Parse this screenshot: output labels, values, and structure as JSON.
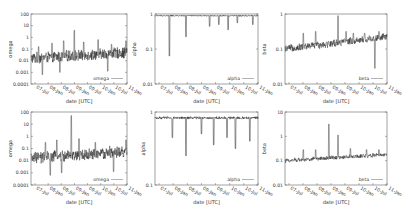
{
  "figure": {
    "x_tick_labels": [
      "07-Jul",
      "08-Jan",
      "08-Jul",
      "09-Jan",
      "09-Jul",
      "10-Jan",
      "10-Jul",
      "11-Jan"
    ],
    "xlabel": "date [UTC]"
  },
  "panels": [
    {
      "id": "top-omega",
      "ylabel": "omega",
      "legend": "omega",
      "yticks": [
        "100",
        "10",
        "1",
        "0.1",
        "0.01",
        "0.001",
        "0.0001"
      ],
      "ylog": [
        -4,
        2
      ]
    },
    {
      "id": "top-alpha",
      "ylabel": "alpha",
      "legend": "alpha",
      "yticks": [
        "1",
        "0.1",
        "0.01"
      ],
      "ylog": [
        -2,
        0
      ]
    },
    {
      "id": "top-beta",
      "ylabel": "beta",
      "legend": "beta",
      "yticks": [
        "1",
        "0.1",
        "0.01"
      ],
      "ylog": [
        -2,
        0
      ]
    },
    {
      "id": "bottom-omega",
      "ylabel": "omega",
      "legend": "omega",
      "yticks": [
        "100",
        "10",
        "1",
        "0.1",
        "0.01",
        "0.001",
        "0.0001"
      ],
      "ylog": [
        -4,
        2
      ]
    },
    {
      "id": "bottom-alpha",
      "ylabel": "alpha",
      "legend": "alpha",
      "yticks": [
        "1",
        "0.1"
      ],
      "ylog": [
        -1,
        0
      ]
    },
    {
      "id": "bottom-beta",
      "ylabel": "beta",
      "legend": "beta",
      "yticks": [
        "10",
        "1",
        "0.1",
        "0.01"
      ],
      "ylog": [
        -2,
        1
      ]
    }
  ],
  "chart_data": [
    {
      "type": "line",
      "title": "",
      "xlabel": "date [UTC]",
      "ylabel": "omega",
      "yscale": "log",
      "ylim": [
        0.0001,
        100
      ],
      "x_tick_labels": [
        "07-Jul",
        "08-Jan",
        "08-Jul",
        "09-Jan",
        "09-Jul",
        "10-Jan",
        "10-Jul",
        "11-Jan"
      ],
      "legend": [
        "omega"
      ],
      "legend_position": "lower right",
      "grid": false,
      "series": [
        {
          "name": "omega",
          "description": "noisy series fluctuating around ~0.01-0.05, spikes up to ~5 near 09-Jan, rising to ~0.5 at 11-Jan"
        }
      ]
    },
    {
      "type": "line",
      "title": "",
      "xlabel": "date [UTC]",
      "ylabel": "alpha",
      "yscale": "log",
      "ylim": [
        0.01,
        1
      ],
      "x_tick_labels": [
        "07-Jul",
        "08-Jan",
        "08-Jul",
        "09-Jan",
        "09-Jul",
        "10-Jan",
        "10-Jul",
        "11-Jan"
      ],
      "legend": [
        "alpha"
      ],
      "legend_position": "lower right",
      "grid": false,
      "series": [
        {
          "name": "alpha",
          "description": "near ~0.85-0.95 throughout with downward spikes; deepest ~0.06 near 08-Jan"
        }
      ]
    },
    {
      "type": "line",
      "title": "",
      "xlabel": "date [UTC]",
      "ylabel": "beta",
      "yscale": "log",
      "ylim": [
        0.01,
        1
      ],
      "x_tick_labels": [
        "07-Jul",
        "08-Jan",
        "08-Jul",
        "09-Jan",
        "09-Jul",
        "10-Jan",
        "10-Jul",
        "11-Jan"
      ],
      "legend": [
        "beta"
      ],
      "legend_position": "lower right",
      "grid": false,
      "series": [
        {
          "name": "beta",
          "description": "around ~0.1-0.2, gradually rising to ~0.2-0.3; spike ~0.9 near 09-Jan; dip ~0.03 near 10-Jul"
        }
      ]
    },
    {
      "type": "line",
      "title": "",
      "xlabel": "date [UTC]",
      "ylabel": "omega",
      "yscale": "log",
      "ylim": [
        0.0001,
        100
      ],
      "x_tick_labels": [
        "07-Jul",
        "08-Jan",
        "08-Jul",
        "09-Jan",
        "09-Jul",
        "10-Jan",
        "10-Jul",
        "11-Jan"
      ],
      "legend": [
        "omega"
      ],
      "legend_position": "lower right",
      "grid": false,
      "series": [
        {
          "name": "omega",
          "description": "noisy around ~0.01-0.05, large spike ~50 near 09-Jan, ends ~0.5"
        }
      ]
    },
    {
      "type": "line",
      "title": "",
      "xlabel": "date [UTC]",
      "ylabel": "alpha",
      "yscale": "log",
      "ylim": [
        0.1,
        1
      ],
      "x_tick_labels": [
        "07-Jul",
        "08-Jan",
        "08-Jul",
        "09-Jan",
        "09-Jul",
        "10-Jan",
        "10-Jul",
        "11-Jan"
      ],
      "legend": [
        "alpha"
      ],
      "legend_position": "lower right",
      "grid": false,
      "series": [
        {
          "name": "alpha",
          "description": "near ~0.8-0.9 with downward spikes; deepest ~0.25 near 08-Jul"
        }
      ]
    },
    {
      "type": "line",
      "title": "",
      "xlabel": "date [UTC]",
      "ylabel": "beta",
      "yscale": "log",
      "ylim": [
        0.01,
        10
      ],
      "x_tick_labels": [
        "07-Jul",
        "08-Jan",
        "08-Jul",
        "09-Jan",
        "09-Jul",
        "10-Jan",
        "10-Jul",
        "11-Jan"
      ],
      "legend": [
        "beta"
      ],
      "legend_position": "lower right",
      "grid": false,
      "series": [
        {
          "name": "beta",
          "description": "around ~0.1, slowly rising to ~0.2; spikes ~3 near 09-Jan and ~1 shortly after"
        }
      ]
    }
  ]
}
